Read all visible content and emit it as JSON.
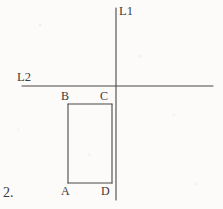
{
  "figure": {
    "item_number": "2.",
    "background_color": "#fcfbfa",
    "ink_color": "#4a4846",
    "stroke_width": 1.1
  },
  "lines": [
    {
      "id": "L1",
      "label": "L1",
      "orientation": "vertical",
      "x1": 116,
      "y1": 8,
      "x2": 116,
      "y2": 200,
      "label_x": 119,
      "label_y": 5
    },
    {
      "id": "L2",
      "label": "L2",
      "orientation": "horizontal",
      "x1": 22,
      "y1": 86,
      "x2": 213,
      "y2": 86,
      "label_x": 17,
      "label_y": 71
    }
  ],
  "intersection": {
    "x": 116,
    "y": 86
  },
  "rectangle": {
    "name": "ABCD",
    "left": 68,
    "top": 104,
    "right": 112,
    "bottom": 183,
    "width": 44,
    "height": 79,
    "vertices": [
      {
        "label": "B",
        "corner": "top-left",
        "x": 68,
        "y": 104,
        "label_x": 61,
        "label_y": 90
      },
      {
        "label": "C",
        "corner": "top-right",
        "x": 112,
        "y": 104,
        "label_x": 100,
        "label_y": 90
      },
      {
        "label": "A",
        "corner": "bottom-left",
        "x": 68,
        "y": 183,
        "label_x": 61,
        "label_y": 185
      },
      {
        "label": "D",
        "corner": "bottom-right",
        "x": 112,
        "y": 183,
        "label_x": 101,
        "label_y": 185
      }
    ]
  },
  "item_number_position": {
    "x": 3,
    "y": 186
  }
}
